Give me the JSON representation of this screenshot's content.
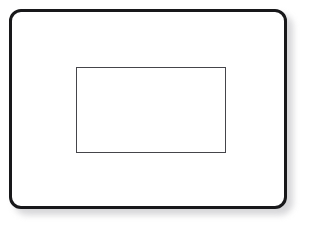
{
  "diagram": {
    "background_color": "#ffffff",
    "outer_frame": {
      "name": "outer-rounded-rectangle",
      "label": "",
      "stroke_color": "#18181a",
      "fill_color": "#ffffff",
      "stroke_width_px": 3,
      "corner_radius_px": 12,
      "x_px": 9,
      "y_px": 9,
      "width_px": 278,
      "height_px": 200,
      "has_drop_shadow": true,
      "shadow_color": "#c9c9cc"
    },
    "inner_rect": {
      "name": "inner-rectangle",
      "label": "",
      "stroke_color": "#45454a",
      "fill_color": "#ffffff",
      "stroke_width_px": 1,
      "corner_radius_px": 0,
      "x_px": 76,
      "y_px": 67,
      "width_px": 150,
      "height_px": 86,
      "has_drop_shadow": false
    }
  }
}
